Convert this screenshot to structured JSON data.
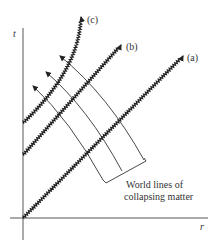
{
  "diagram": {
    "type": "spacetime-diagram",
    "axes": {
      "vertical_label": "t",
      "horizontal_label": "r"
    },
    "photon_lines": [
      {
        "id": "a",
        "label": "(a)"
      },
      {
        "id": "b",
        "label": "(b)"
      },
      {
        "id": "c",
        "label": "(c)"
      }
    ],
    "caption": {
      "line1": "World lines of",
      "line2": "collapsing matter"
    },
    "colors": {
      "ink": "#222222",
      "background": "#ffffff"
    }
  }
}
